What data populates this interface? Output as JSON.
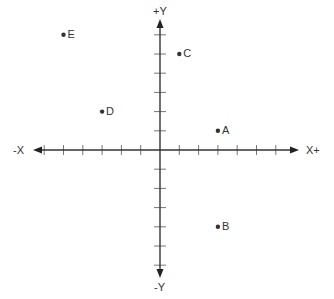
{
  "chart_data": {
    "type": "scatter",
    "title": "",
    "xlabel_pos": "X+",
    "xlabel_neg": "-X",
    "ylabel_pos": "+Y",
    "ylabel_neg": "-Y",
    "grid": false,
    "ticks_per_half_axis": 6,
    "xlim": [
      -6,
      6
    ],
    "ylim": [
      -6,
      6
    ],
    "points": [
      {
        "label": "A",
        "x": 3,
        "y": 1
      },
      {
        "label": "B",
        "x": 3,
        "y": -4
      },
      {
        "label": "C",
        "x": 1,
        "y": 5
      },
      {
        "label": "D",
        "x": -3,
        "y": 2
      },
      {
        "label": "E",
        "x": -5,
        "y": 6
      }
    ],
    "colors": {
      "axis": "#333333",
      "point": "#333333",
      "tick": "#777777"
    }
  },
  "labels": {
    "x_pos": "X+",
    "x_neg": "-X",
    "y_pos": "+Y",
    "y_neg": "-Y"
  }
}
